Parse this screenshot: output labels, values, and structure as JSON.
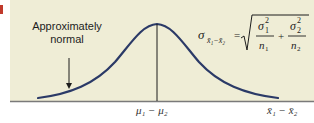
{
  "figure": {
    "annotation": {
      "line1": "Approximately",
      "line2": "normal"
    },
    "axis": {
      "center_label": "μ₁ − μ₂",
      "axis_label": "x̄₁ − x̄₂"
    },
    "formula": {
      "lhs": "σ",
      "lhs_subscript": "x̄₁−x̄₂",
      "equals": "=",
      "term1_num": "σ",
      "term1_num_sub": "1",
      "term1_num_sup": "2",
      "term1_den": "n",
      "term1_den_sub": "1",
      "plus": "+",
      "term2_num": "σ",
      "term2_num_sub": "2",
      "term2_num_sup": "2",
      "term2_den": "n",
      "term2_den_sub": "2",
      "full_text": "σ_{x̄₁−x̄₂} = √(σ₁²/n₁ + σ₂²/n₂)"
    },
    "colors": {
      "background": "#efedd6",
      "curve": "#2b3a67",
      "axis": "#7a7a7a",
      "marker": "#c0392b"
    }
  }
}
